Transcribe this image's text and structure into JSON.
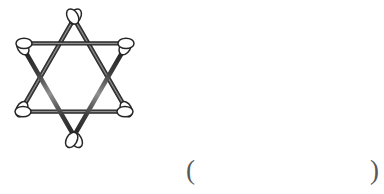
{
  "page": {
    "background_color": "#ffffff",
    "width": 384,
    "height": 194
  },
  "figure": {
    "name": "cotton-swab-hexagram",
    "object_type": "cotton-swab",
    "object_count": 6,
    "shape": "hexagram",
    "points": 6,
    "triangles": 2,
    "colors": {
      "stick_dark": "#2b2b2b",
      "stick_mid": "#4a4a4a",
      "stick_light": "#8c8c8c",
      "tip_fill": "#ffffff",
      "tip_outline": "#2b2b2b"
    },
    "swabs": [
      {
        "id": 1,
        "label": "upper-horizontal-swab",
        "orientation": "horizontal",
        "position": "upper"
      },
      {
        "id": 2,
        "label": "lower-horizontal-swab",
        "orientation": "horizontal",
        "position": "lower"
      },
      {
        "id": 3,
        "label": "upper-left-diagonal-swab",
        "orientation": "diagonal",
        "position": "upper-left"
      },
      {
        "id": 4,
        "label": "upper-right-diagonal-swab",
        "orientation": "diagonal",
        "position": "upper-right"
      },
      {
        "id": 5,
        "label": "lower-left-diagonal-swab",
        "orientation": "diagonal",
        "position": "lower-left"
      },
      {
        "id": 6,
        "label": "lower-right-diagonal-swab",
        "orientation": "diagonal",
        "position": "lower-right"
      }
    ],
    "vertices": [
      {
        "name": "top-vertex",
        "x": 70,
        "y": 16
      },
      {
        "name": "upper-left-vertex",
        "x": 22,
        "y": 46
      },
      {
        "name": "upper-right-vertex",
        "x": 126,
        "y": 46
      },
      {
        "name": "lower-left-vertex",
        "x": 22,
        "y": 111
      },
      {
        "name": "lower-right-vertex",
        "x": 126,
        "y": 111
      },
      {
        "name": "bottom-vertex",
        "x": 70,
        "y": 140
      }
    ]
  },
  "answer_blank": {
    "open_paren": "(",
    "close_paren": ")",
    "value": "",
    "placeholder": ""
  }
}
